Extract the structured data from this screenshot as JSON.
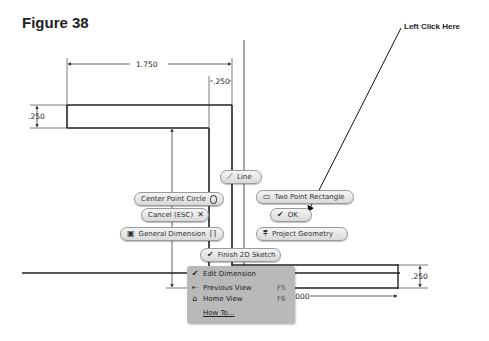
{
  "header": {
    "cut_text": "…figure continued from previous page…",
    "figure_title": "Figure 38",
    "callout": "Left Click Here"
  },
  "dimensions": {
    "top_width": "1.750",
    "top_small": ".250",
    "left_thickness": ".250",
    "vertical_height": "1.750",
    "right_thickness": ".250",
    "bottom_width": "2.000"
  },
  "marking_menu": {
    "line": "Line",
    "center_point_circle": "Center Point Circle",
    "two_point_rectangle": "Two Point Rectangle",
    "cancel": "Cancel (ESC)",
    "ok": "OK",
    "general_dimension": "General Dimension",
    "project_geometry": "Project Geometry",
    "finish_sketch": "Finish 2D Sketch"
  },
  "context_menu": {
    "items": [
      {
        "label": "Edit Dimension",
        "shortcut": "",
        "icon": "check-icon"
      },
      {
        "label": "Previous View",
        "shortcut": "F5",
        "icon": "previous-view-icon"
      },
      {
        "label": "Home View",
        "shortcut": "F6",
        "icon": "home-icon"
      },
      {
        "label": "How To...",
        "shortcut": "",
        "icon": ""
      }
    ]
  }
}
